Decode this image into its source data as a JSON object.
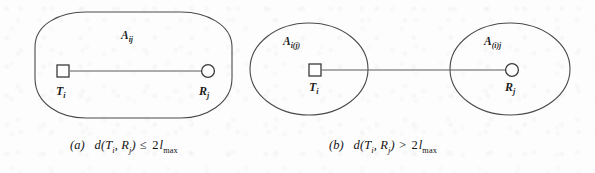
{
  "figure": {
    "background_color": "#fdfdfd",
    "stroke_color": "#4a4a4a",
    "panels": [
      {
        "id": "a",
        "caption_tag": "(a)",
        "caption_function": "d",
        "caption_args_open": "(",
        "caption_arg1_base": "T",
        "caption_arg1_sub": "i",
        "caption_sep": ", ",
        "caption_arg2_base": "R",
        "caption_arg2_sub": "j",
        "caption_args_close": ")",
        "caption_relation": "≤",
        "caption_rhs_coeff": "2",
        "caption_rhs_base": "l",
        "caption_rhs_sub": "max",
        "region_shape": "stadium",
        "region_label_base": "A",
        "region_label_sub": "ij",
        "transmitter_marker": "square",
        "transmitter_label_base": "T",
        "transmitter_label_sub": "i",
        "receiver_marker": "circle",
        "receiver_label_base": "R",
        "receiver_label_sub": "j"
      },
      {
        "id": "b",
        "caption_tag": "(b)",
        "caption_function": "d",
        "caption_args_open": "(",
        "caption_arg1_base": "T",
        "caption_arg1_sub": "i",
        "caption_sep": ", ",
        "caption_arg2_base": "R",
        "caption_arg2_sub": "j",
        "caption_args_close": ")",
        "caption_relation": ">",
        "caption_rhs_coeff": "2",
        "caption_rhs_base": "l",
        "caption_rhs_sub": "max",
        "region_shape": "two-ellipses",
        "left_region_label_base": "A",
        "left_region_label_sub": "i(j)",
        "right_region_label_base": "A",
        "right_region_label_sub": "(i)j",
        "transmitter_marker": "square",
        "transmitter_label_base": "T",
        "transmitter_label_sub": "i",
        "receiver_marker": "circle",
        "receiver_label_base": "R",
        "receiver_label_sub": "j"
      }
    ]
  }
}
